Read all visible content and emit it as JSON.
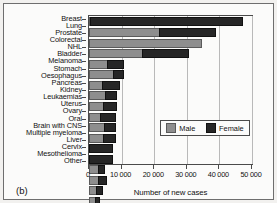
{
  "panel_label": "(b)",
  "legend": {
    "male_label": "Male",
    "female_label": "Female",
    "male_color": "#8e8e8e",
    "female_color": "#262626"
  },
  "chart_data": {
    "type": "bar",
    "orientation": "horizontal",
    "stacked": true,
    "title": "",
    "xlabel": "Number of new cases",
    "ylabel": "",
    "xlim": [
      0,
      50000
    ],
    "xticks": [
      0,
      10000,
      20000,
      30000,
      40000,
      50000
    ],
    "xticklabels": [
      "0",
      "10 000",
      "20 000",
      "30 000",
      "40 000",
      "50 000"
    ],
    "grid": "vertical",
    "legend_position": "inside-lower-right",
    "categories": [
      "Breast",
      "Lung",
      "Prostate",
      "Colorectal",
      "NHL",
      "Bladder",
      "Melanoma",
      "Stomach",
      "Oesophagus",
      "Pancreas",
      "Kidney",
      "Leukaemias",
      "Uterus",
      "Ovary",
      "Oral",
      "Brain with CNS",
      "Multiple myeloma",
      "Liver",
      "Cervix",
      "Mesothelioma",
      "Other"
    ],
    "series": [
      {
        "name": "Male",
        "color": "#8e8e8e",
        "values": [
          300,
          21500,
          34000,
          16200,
          5500,
          7300,
          4000,
          4900,
          4400,
          3500,
          4700,
          4300,
          0,
          0,
          2700,
          2700,
          2100,
          1700,
          0,
          1700,
          19500
        ]
      },
      {
        "name": "Female",
        "color": "#262626",
        "values": [
          46400,
          17000,
          0,
          13800,
          4700,
          2700,
          5000,
          3100,
          3500,
          4200,
          3000,
          3400,
          6900,
          6900,
          1600,
          2100,
          1700,
          1200,
          2800,
          400,
          17200
        ]
      }
    ],
    "totals": [
      46700,
      38500,
      34000,
      30000,
      10200,
      10000,
      9000,
      8000,
      7900,
      7700,
      7700,
      7700,
      6900,
      6900,
      4300,
      4800,
      3800,
      2900,
      2800,
      2100,
      36700
    ]
  }
}
